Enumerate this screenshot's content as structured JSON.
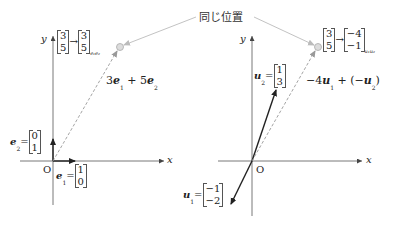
{
  "annotation": {
    "same_position_label": "同じ位置"
  },
  "left_panel": {
    "axis_x": "x",
    "axis_y": "y",
    "origin": "O",
    "mapping": {
      "from": [
        "3",
        "5"
      ],
      "arrow": "→",
      "to": [
        "3",
        "5"
      ],
      "basis_subscript": "e₁e₂"
    },
    "combination": {
      "c1": "3",
      "v1": "e",
      "s1": "1",
      "op": "+",
      "c2": "5",
      "v2": "e",
      "s2": "2"
    },
    "e1": {
      "name": "e",
      "sub": "1",
      "eq": "=",
      "values": [
        "1",
        "0"
      ]
    },
    "e2": {
      "name": "e",
      "sub": "2",
      "eq": "=",
      "values": [
        "0",
        "1"
      ]
    }
  },
  "right_panel": {
    "axis_x": "x",
    "axis_y": "y",
    "origin": "O",
    "mapping": {
      "from": [
        "3",
        "5"
      ],
      "arrow": "→",
      "to": [
        "−4",
        "−1"
      ],
      "basis_subscript": "u₁u₂"
    },
    "combination": {
      "c1": "−4",
      "v1": "u",
      "s1": "1",
      "op": "+ (−",
      "v2": "u",
      "s2": "2",
      "close": ")"
    },
    "u1": {
      "name": "u",
      "sub": "1",
      "eq": "=",
      "values": [
        "−1",
        "−2"
      ]
    },
    "u2": {
      "name": "u",
      "sub": "2",
      "eq": "=",
      "values": [
        "1",
        "3"
      ]
    }
  },
  "colors": {
    "axis": "#555555",
    "vector": "#222222",
    "dashed": "#9a9a9a",
    "leader": "#bbbbbb",
    "point_fill": "#dcdcdc"
  }
}
